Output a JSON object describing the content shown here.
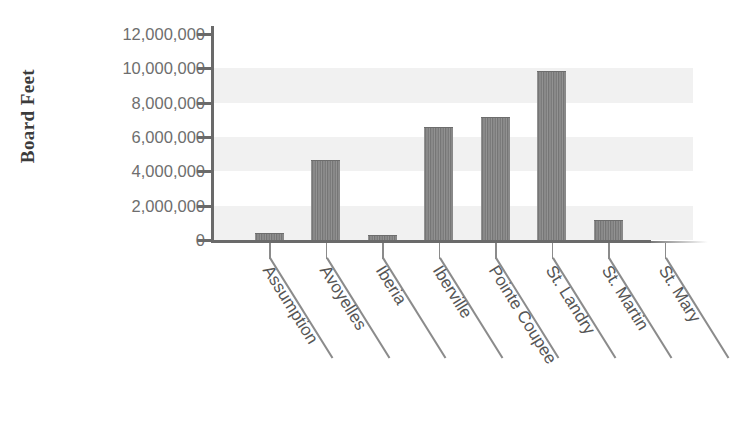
{
  "chart_data": {
    "type": "bar",
    "title": "",
    "xlabel": "",
    "ylabel": "Board Feet",
    "categories": [
      "Assumption",
      "Avoyelles",
      "Iberia",
      "Iberville",
      "Pointe Coupee",
      "St. Landry",
      "St. Martin",
      "St. Mary"
    ],
    "values": [
      350000,
      4600000,
      250000,
      6500000,
      7100000,
      9800000,
      1100000,
      0
    ],
    "ylim": [
      0,
      12000000
    ],
    "ytick_values": [
      0,
      2000000,
      4000000,
      6000000,
      8000000,
      10000000,
      12000000
    ],
    "ytick_labels": [
      "12,000,000",
      "10,000,000",
      "8,000,000",
      "6,000,000",
      "4,000,000",
      "2,000,000",
      "0"
    ],
    "grid": false,
    "alternating_bands": true,
    "legend": null,
    "bar_color": "#838383",
    "band_color": "#f1f1f1",
    "axis_color": "#6a6a6a",
    "tick_label_color": "#6e6e6e",
    "xlabel_rotation_deg": 58
  },
  "axis": {
    "y_title": "Board Feet"
  }
}
